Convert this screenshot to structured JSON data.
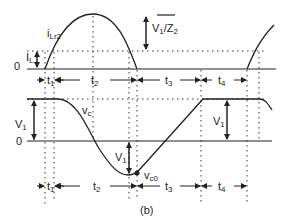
{
  "figure": {
    "caption": "(b)",
    "top_waveform": {
      "name": "i_Lr2",
      "label_main": "i",
      "label_sub": "Lr2",
      "zero_label": "0",
      "il_label_main": "I",
      "il_label_sub": "L",
      "peak_label": "V1/Z2",
      "peak_label_main": "V",
      "peak_label_sub": "1",
      "peak_label_rest": "/Z",
      "peak_label_sub2": "2"
    },
    "bottom_waveform": {
      "name": "v_c",
      "label_main": "v",
      "label_sub": "c",
      "zero_label": "0",
      "v1_label_main": "V",
      "v1_label_sub": "1",
      "min_label_main": "v",
      "min_label_sub": "c0"
    },
    "intervals": [
      {
        "main": "t",
        "sub": "1"
      },
      {
        "main": "t",
        "sub": "2"
      },
      {
        "main": "t",
        "sub": "3"
      },
      {
        "main": "t",
        "sub": "4"
      }
    ],
    "colors": {
      "line": "#222222",
      "dotted": "#333333",
      "background": "#ffffff"
    }
  }
}
